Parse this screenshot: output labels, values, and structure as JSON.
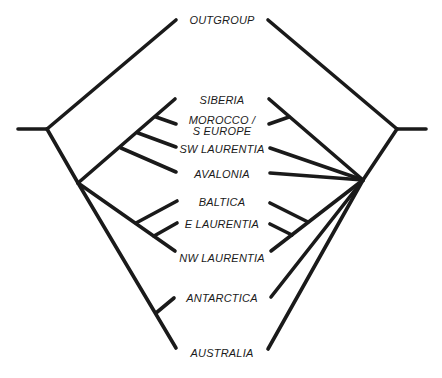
{
  "diagram": {
    "type": "mirrored-cladograms",
    "line_color": "#1a1a1a",
    "background": "#ffffff"
  },
  "taxa": [
    {
      "id": "outgroup",
      "label": "OUTGROUP"
    },
    {
      "id": "siberia",
      "label": "SIBERIA"
    },
    {
      "id": "morocco",
      "label": "MOROCCO /",
      "label2": "S EUROPE"
    },
    {
      "id": "sw_laurentia",
      "label": "SW LAURENTIA"
    },
    {
      "id": "avalonia",
      "label": "AVALONIA"
    },
    {
      "id": "baltica",
      "label": "BALTICA"
    },
    {
      "id": "e_laurentia",
      "label": "E LAURENTIA"
    },
    {
      "id": "nw_laurentia",
      "label": "NW LAURENTIA"
    },
    {
      "id": "antarctica",
      "label": "ANTARCTICA"
    },
    {
      "id": "australia",
      "label": "AUSTRALIA"
    }
  ],
  "trees": {
    "left": {
      "topology": "(OUTGROUP,((((SIBERIA,MOROCCO/S EUROPE),SW LAURENTIA),AVALONIA),((BALTICA,E LAURENTIA),NW LAURENTIA),(ANTARCTICA,AUSTRALIA)))"
    },
    "right": {
      "topology": "(OUTGROUP,((SIBERIA,MOROCCO/S EUROPE),SW LAURENTIA,AVALONIA,(BALTICA,(E LAURENTIA,NW LAURENTIA)),ANTARCTICA,AUSTRALIA))"
    }
  }
}
